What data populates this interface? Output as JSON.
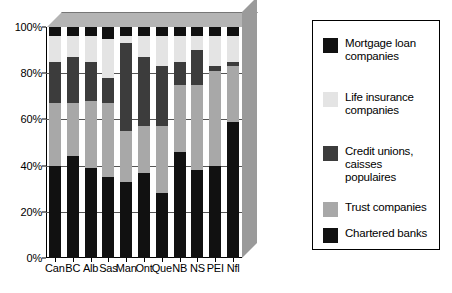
{
  "chart_data": {
    "type": "bar",
    "subtype": "stacked-percent-3d",
    "title": "",
    "xlabel": "",
    "ylabel": "",
    "ylim": [
      0,
      100
    ],
    "ytick_labels": [
      "0%",
      "20%",
      "40%",
      "60%",
      "80%",
      "100%"
    ],
    "ytick_values": [
      0,
      20,
      40,
      60,
      80,
      100
    ],
    "grid": true,
    "legend_position": "right",
    "categories": [
      "Can",
      "BC",
      "Alb",
      "Sas",
      "Man",
      "Ont",
      "Que",
      "NB",
      "NS",
      "PEI",
      "Nfl"
    ],
    "series": [
      {
        "name": "Chartered banks",
        "color": "#111111",
        "values": [
          40,
          44,
          39,
          35,
          33,
          37,
          28,
          46,
          38,
          40,
          59
        ]
      },
      {
        "name": "Trust companies",
        "color": "#a8a8a8",
        "values": [
          27,
          23,
          29,
          32,
          22,
          20,
          29,
          29,
          37,
          41,
          24
        ]
      },
      {
        "name": "Credit unions, caisses populaires",
        "color": "#3c3c3c",
        "values": [
          18,
          20,
          17,
          11,
          38,
          30,
          26,
          10,
          15,
          2,
          2
        ]
      },
      {
        "name": "Life insurance companies",
        "color": "#e4e4e4",
        "values": [
          11,
          9,
          11,
          17,
          3,
          9,
          13,
          11,
          6,
          13,
          11
        ]
      },
      {
        "name": "Mortgage loan companies",
        "color": "#111111",
        "values": [
          4,
          4,
          4,
          5,
          4,
          4,
          4,
          4,
          4,
          4,
          4
        ]
      }
    ],
    "legend_order": [
      "Mortgage loan companies",
      "Life insurance companies",
      "Credit unions, caisses populaires",
      "Trust companies",
      "Chartered banks"
    ]
  },
  "legend": {
    "items": [
      {
        "key": "mortgage",
        "label": "Mortgage loan\ncompanies"
      },
      {
        "key": "life",
        "label": "Life insurance\ncompanies"
      },
      {
        "key": "credit",
        "label": "Credit unions,\ncaisses\npopulaires"
      },
      {
        "key": "trust",
        "label": "Trust companies"
      },
      {
        "key": "banks",
        "label": "Chartered banks"
      }
    ]
  },
  "colors": {
    "mortgage": "#111111",
    "life": "#e4e4e4",
    "credit": "#3c3c3c",
    "trust": "#a8a8a8",
    "banks": "#111111",
    "floor_top": "#b4b4b4",
    "floor_right": "#9a9a9a",
    "gridline": "#555555",
    "axis": "#000000",
    "background": "#ffffff"
  }
}
